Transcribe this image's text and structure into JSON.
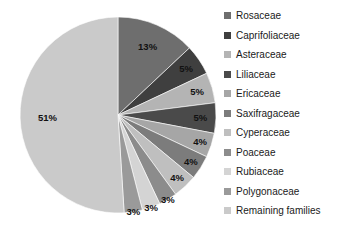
{
  "chart_data": {
    "type": "pie",
    "title": "",
    "xlabel": "",
    "ylabel": "",
    "legend_position": "right",
    "grid": false,
    "start_angle_deg": 0,
    "direction": "clockwise",
    "categories": [
      "Rosaceae",
      "Caprifoliaceae",
      "Asteraceae",
      "Liliaceae",
      "Ericaceae",
      "Saxifragaceae",
      "Cyperaceae",
      "Poaceae",
      "Rubiaceae",
      "Polygonaceae",
      "Remaining families"
    ],
    "values": [
      13,
      5,
      5,
      5,
      4,
      4,
      4,
      3,
      3,
      3,
      51
    ],
    "data_labels": [
      "13%",
      "5%",
      "5%",
      "5%",
      "4%",
      "4%",
      "4%",
      "3%",
      "3%",
      "3%",
      "51%"
    ],
    "colors": [
      "#6E6E6E",
      "#3F3F3F",
      "#B4B4B4",
      "#4A4A4A",
      "#A6A6A6",
      "#7C7C7C",
      "#BFBFBF",
      "#8C8C8C",
      "#D4D4D4",
      "#9A9A9A",
      "#CACACA"
    ],
    "slices": [
      {
        "label": "Rosaceae",
        "value": 13,
        "data_label": "13%",
        "color": "#6E6E6E"
      },
      {
        "label": "Caprifoliaceae",
        "value": 5,
        "data_label": "5%",
        "color": "#3F3F3F"
      },
      {
        "label": "Asteraceae",
        "value": 5,
        "data_label": "5%",
        "color": "#B4B4B4"
      },
      {
        "label": "Liliaceae",
        "value": 5,
        "data_label": "5%",
        "color": "#4A4A4A"
      },
      {
        "label": "Ericaceae",
        "value": 4,
        "data_label": "4%",
        "color": "#A6A6A6"
      },
      {
        "label": "Saxifragaceae",
        "value": 4,
        "data_label": "4%",
        "color": "#7C7C7C"
      },
      {
        "label": "Cyperaceae",
        "value": 4,
        "data_label": "4%",
        "color": "#BFBFBF"
      },
      {
        "label": "Poaceae",
        "value": 3,
        "data_label": "3%",
        "color": "#8C8C8C"
      },
      {
        "label": "Rubiaceae",
        "value": 3,
        "data_label": "3%",
        "color": "#D4D4D4"
      },
      {
        "label": "Polygonaceae",
        "value": 3,
        "data_label": "3%",
        "color": "#9A9A9A"
      },
      {
        "label": "Remaining families",
        "value": 51,
        "data_label": "51%",
        "color": "#CACACA"
      }
    ]
  },
  "legend": {
    "items": [
      {
        "label": "Rosaceae",
        "color": "#6E6E6E"
      },
      {
        "label": "Caprifoliaceae",
        "color": "#3F3F3F"
      },
      {
        "label": "Asteraceae",
        "color": "#B4B4B4"
      },
      {
        "label": "Liliaceae",
        "color": "#4A4A4A"
      },
      {
        "label": "Ericaceae",
        "color": "#A6A6A6"
      },
      {
        "label": "Saxifragaceae",
        "color": "#7C7C7C"
      },
      {
        "label": "Cyperaceae",
        "color": "#BFBFBF"
      },
      {
        "label": "Poaceae",
        "color": "#8C8C8C"
      },
      {
        "label": "Rubiaceae",
        "color": "#D4D4D4"
      },
      {
        "label": "Polygonaceae",
        "color": "#9A9A9A"
      },
      {
        "label": "Remaining families",
        "color": "#CACACA"
      }
    ]
  },
  "geometry": {
    "center_x": 118,
    "center_y": 115,
    "radius": 98,
    "label_radius_ratio": 0.76
  }
}
